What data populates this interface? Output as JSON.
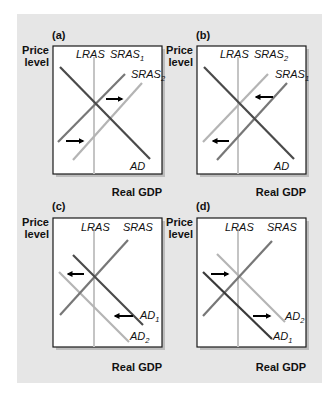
{
  "colors": {
    "background": "#ffffff",
    "panel": "#e6e6e6",
    "plot": "#ffffff",
    "ad_dark": "#4a4a4a",
    "sras_medium": "#777777",
    "light": "#b4b4b4",
    "lras": "#c4c4c4",
    "arrow": "#000000"
  },
  "axis_labels": {
    "y_line1": "Price",
    "y_line2": "level",
    "x": "Real GDP"
  },
  "panels": [
    {
      "id": "a",
      "label": "(a)",
      "curves": [
        {
          "name": "LRAS",
          "base": "LRAS",
          "sub": "",
          "kind": "vertical",
          "shade": "lras"
        },
        {
          "name": "SRAS1",
          "base": "SRAS",
          "sub": "1",
          "kind": "upward",
          "shade": "sras_medium"
        },
        {
          "name": "SRAS2",
          "base": "SRAS",
          "sub": "2",
          "kind": "upward",
          "shade": "light"
        },
        {
          "name": "AD",
          "base": "AD",
          "sub": "",
          "kind": "downward",
          "shade": "ad_dark"
        }
      ],
      "shift": {
        "curve": "SRAS",
        "from": "SRAS1",
        "to": "SRAS2",
        "direction": "right"
      }
    },
    {
      "id": "b",
      "label": "(b)",
      "curves": [
        {
          "name": "LRAS",
          "base": "LRAS",
          "sub": "",
          "kind": "vertical",
          "shade": "lras"
        },
        {
          "name": "SRAS2",
          "base": "SRAS",
          "sub": "2",
          "kind": "upward",
          "shade": "light"
        },
        {
          "name": "SRAS1",
          "base": "SRAS",
          "sub": "1",
          "kind": "upward",
          "shade": "sras_medium"
        },
        {
          "name": "AD",
          "base": "AD",
          "sub": "",
          "kind": "downward",
          "shade": "ad_dark"
        }
      ],
      "shift": {
        "curve": "SRAS",
        "from": "SRAS1",
        "to": "SRAS2",
        "direction": "left"
      }
    },
    {
      "id": "c",
      "label": "(c)",
      "curves": [
        {
          "name": "LRAS",
          "base": "LRAS",
          "sub": "",
          "kind": "vertical",
          "shade": "lras"
        },
        {
          "name": "SRAS",
          "base": "SRAS",
          "sub": "",
          "kind": "upward",
          "shade": "sras_medium"
        },
        {
          "name": "AD1",
          "base": "AD",
          "sub": "1",
          "kind": "downward",
          "shade": "ad_dark"
        },
        {
          "name": "AD2",
          "base": "AD",
          "sub": "2",
          "kind": "downward",
          "shade": "light"
        }
      ],
      "shift": {
        "curve": "AD",
        "from": "AD1",
        "to": "AD2",
        "direction": "left"
      }
    },
    {
      "id": "d",
      "label": "(d)",
      "curves": [
        {
          "name": "LRAS",
          "base": "LRAS",
          "sub": "",
          "kind": "vertical",
          "shade": "lras"
        },
        {
          "name": "SRAS",
          "base": "SRAS",
          "sub": "",
          "kind": "upward",
          "shade": "sras_medium"
        },
        {
          "name": "AD2",
          "base": "AD",
          "sub": "2",
          "kind": "downward",
          "shade": "light"
        },
        {
          "name": "AD1",
          "base": "AD",
          "sub": "1",
          "kind": "downward",
          "shade": "ad_dark"
        }
      ],
      "shift": {
        "curve": "AD",
        "from": "AD1",
        "to": "AD2",
        "direction": "right"
      }
    }
  ]
}
